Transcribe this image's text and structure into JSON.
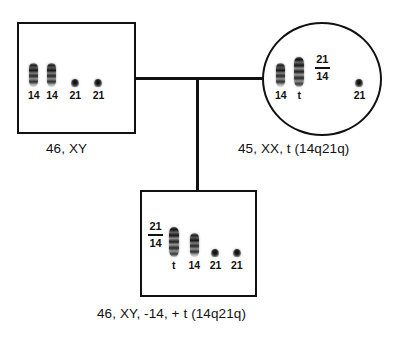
{
  "diagram": {
    "line_color": "#111111",
    "background_color": "#ffffff"
  },
  "individuals": [
    {
      "id": "father",
      "symbol": "square",
      "sex": "male",
      "caption": "46, XY",
      "chromosomes": [
        {
          "label": "14",
          "type": "long"
        },
        {
          "label": "14",
          "type": "long"
        },
        {
          "label": "21",
          "type": "small"
        },
        {
          "label": "21",
          "type": "small"
        }
      ],
      "annotation": null
    },
    {
      "id": "mother",
      "symbol": "circle",
      "sex": "female",
      "caption": "45, XX, t (14q21q)",
      "chromosomes": [
        {
          "label": "14",
          "type": "long"
        },
        {
          "label": "t",
          "type": "xlong"
        },
        {
          "label": "21",
          "type": "small"
        }
      ],
      "annotation": {
        "numerator": "21",
        "denominator": "14"
      }
    },
    {
      "id": "child",
      "symbol": "square",
      "sex": "male",
      "caption": "46, XY, -14,  + t (14q21q)",
      "chromosomes": [
        {
          "label": "t",
          "type": "xlong"
        },
        {
          "label": "14",
          "type": "long"
        },
        {
          "label": "21",
          "type": "small"
        },
        {
          "label": "21",
          "type": "small"
        }
      ],
      "annotation": {
        "numerator": "21",
        "denominator": "14"
      }
    }
  ]
}
